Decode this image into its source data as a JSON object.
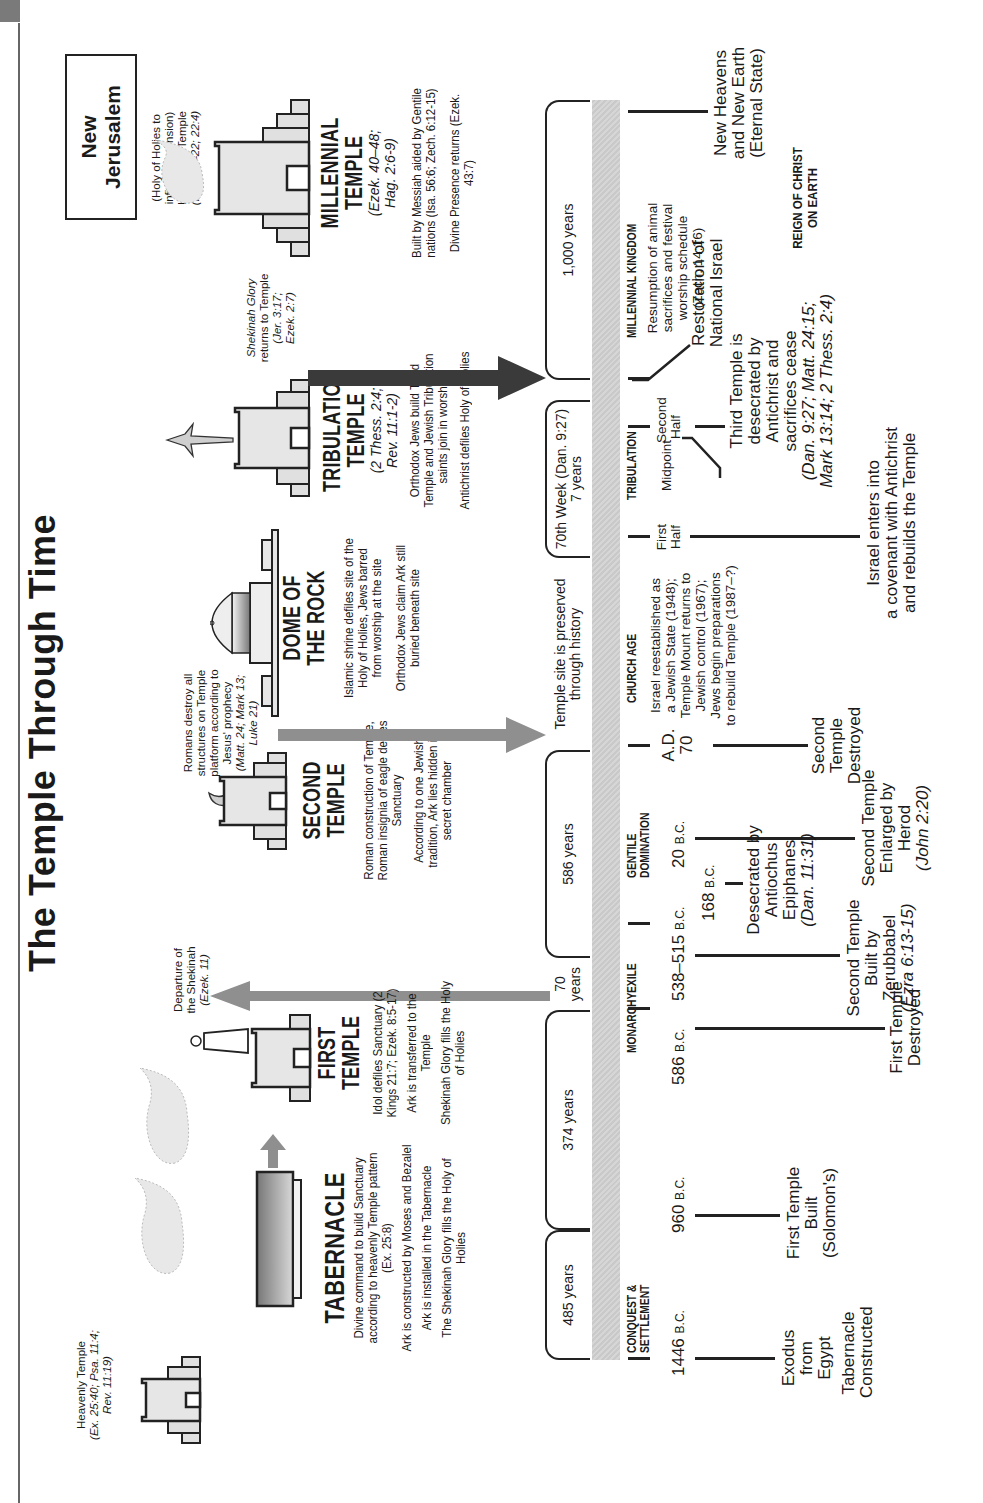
{
  "header": {
    "label": ""
  },
  "title": "The Temple Through Time",
  "new_jerusalem": {
    "label_line1": "New",
    "label_line2": "Jerusalem",
    "note_line1": "(Holy of Holies to",
    "note_line2": "infinite dimension)",
    "note_line3": "Lord is the Temple",
    "note_line4": "(Rev. 21–22; 22:4)"
  },
  "heavenly_temple": {
    "label": "Heavenly Temple",
    "ref_line1": "(Ex. 25:40; Psa. 11:4;",
    "ref_line2": "Rev. 11:19)"
  },
  "temples": [
    {
      "name": "TABERNACLE",
      "ref": "",
      "desc": [
        "Divine command to build Sanctuary according to heavenly Temple pattern (Ex. 25:8)",
        "Ark is constructed by Moses and Bezalel",
        "Ark is installed in the Tabernacle",
        "The Shekinah Glory fills the Holy of Holies"
      ]
    },
    {
      "name_line1": "FIRST",
      "name_line2": "TEMPLE",
      "desc": [
        "Idol defiles Sanctuary (2 Kings 21:7; Ezek. 8:5-17)",
        "Ark is transferred to the Temple",
        "Shekinah Glory fills the Holy of Holies"
      ]
    },
    {
      "name_line1": "SECOND",
      "name_line2": "TEMPLE",
      "desc": [
        "Roman construction of Temple, Roman insignia of eagle defiles Sanctuary",
        "According to one Jewish tradition, Ark lies hidden in secret chamber"
      ]
    },
    {
      "name_line1": "DOME OF",
      "name_line2": "THE ROCK",
      "desc": [
        "Islamic shrine defiles site of the Holy of Holies, Jews barred from worship at the site",
        "Orthodox Jews claim Ark still buried beneath site"
      ]
    },
    {
      "name_line1": "TRIBULATION",
      "name_line2": "TEMPLE",
      "ref_line1": "(2 Thess. 2:4;",
      "ref_line2": "Rev. 11:1-2)",
      "desc": [
        "Orthodox Jews build Third Temple and Jewish Tribulation saints join in worship",
        "Antichrist defiles Holy of Holies"
      ]
    },
    {
      "name_line1": "MILLENNIAL",
      "name_line2": "TEMPLE",
      "ref_line1": "(Ezek. 40–48;",
      "ref_line2": "Hag. 2:6-9)",
      "desc": [
        "Built by Messiah aided by Gentile nations (Isa. 56:6; Zech. 6:12-15)",
        "Divine Presence returns (Ezek. 43:7)"
      ]
    }
  ],
  "arrow_notes": {
    "departure": [
      "Departure of",
      "the Shekinah",
      "(Ezek. 11)"
    ],
    "romans": [
      "Romans destroy all",
      "structures on Temple",
      "platform according to",
      "Jesus' prophecy",
      "(Matt. 24; Mark 13;",
      "Luke 21)"
    ],
    "shekinah_returns": [
      "Shekinah Glory",
      "returns to Temple",
      "(Jer. 3:17;",
      "Ezek. 2:7)"
    ]
  },
  "brackets": [
    {
      "label": "485 years"
    },
    {
      "label": "374 years"
    },
    {
      "label_line1": "70",
      "label_line2": "years"
    },
    {
      "label": "586 years"
    },
    {
      "label_line1": "Temple site is preserved",
      "label_line2": "through history"
    },
    {
      "label_line1": "70th Week (Dan. 9:27)",
      "label_line2": "7 years"
    },
    {
      "label": "1,000 years"
    }
  ],
  "eras": [
    {
      "line1": "CONQUEST &",
      "line2": "SETTLEMENT"
    },
    {
      "line1": "MONARCHY"
    },
    {
      "line1": "EXILE"
    },
    {
      "line1": "GENTILE",
      "line2": "DOMINATION"
    },
    {
      "line1": "CHURCH AGE"
    },
    {
      "line1": "TRIBULATION"
    },
    {
      "line1": "MILLENNIAL KINGDOM"
    }
  ],
  "dates": [
    {
      "num": "1446",
      "era": "B.C."
    },
    {
      "num": "960",
      "era": "B.C."
    },
    {
      "num": "586",
      "era": "B.C."
    },
    {
      "num": "538–515",
      "era": "B.C."
    },
    {
      "num": "168",
      "era": "B.C."
    },
    {
      "num": "20",
      "era": "B.C."
    },
    {
      "line1": "A.D.",
      "line2": "70"
    }
  ],
  "halves": {
    "first": [
      "First",
      "Half"
    ],
    "midpoint": "Midpoint",
    "second": [
      "Second",
      "Half"
    ]
  },
  "events": {
    "exodus": [
      "Exodus",
      "from Egypt"
    ],
    "tabernacle_constructed": [
      "Tabernacle",
      "Constructed"
    ],
    "first_temple_built": [
      "First Temple",
      "Built",
      "(Solomon's)"
    ],
    "first_temple_destroyed": [
      "First Temple",
      "Destroyed"
    ],
    "second_temple_built": [
      "Second Temple",
      "Built by",
      "Zerubbabel",
      "(Ezra 6:13-15)"
    ],
    "desecrated": [
      "Desecrated by",
      "Antiochus",
      "Epiphanes",
      "(Dan. 11:31)"
    ],
    "enlarged": [
      "Second Temple",
      "Enlarged by Herod",
      "(John 2:20)"
    ],
    "second_destroyed": [
      "Second Temple",
      "Destroyed"
    ],
    "church_age_note": [
      "Israel reestablished as",
      "a Jewish State (1948);",
      "Temple Mount returns to",
      "Jewish control (1967);",
      "Jews begin preparations",
      "to rebuild Temple (1987–?)"
    ],
    "covenant": [
      "Israel enters into",
      "a covenant with Antichrist",
      "and rebuilds the Temple"
    ],
    "third_desecrated": [
      "Third Temple is",
      "desecrated by",
      "Antichrist and",
      "sacrifices cease",
      "(Dan. 9:27; Matt. 24:15;",
      "Mark 13:14; 2 Thess. 2:4)"
    ],
    "restoration": [
      "Restoration of",
      "National Israel"
    ],
    "resumption": [
      "Resumption of animal",
      "sacrifices and festival",
      "worship schedule",
      "(Zech. 14:16)"
    ],
    "new_heavens": [
      "New Heavens",
      "and New Earth",
      "(Eternal State)"
    ],
    "reign": [
      "REIGN OF CHRIST",
      "ON EARTH"
    ]
  },
  "colors": {
    "ink": "#1a1a1a",
    "band": "#cfcfcf",
    "arrow_gray": "#8f8f8f",
    "arrow_dark": "#3a3a3a",
    "temple_fill": "#e2e2e2"
  }
}
